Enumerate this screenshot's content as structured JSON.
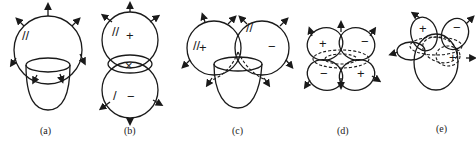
{
  "figure": {
    "panels": [
      {
        "id": "a",
        "caption": "(a)",
        "signs": [],
        "description": "single lobe above cup with outward arrows"
      },
      {
        "id": "b",
        "caption": "(b)",
        "signs": [
          "+",
          "×",
          "−"
        ],
        "description": "two vertically stacked lobes"
      },
      {
        "id": "c",
        "caption": "(c)",
        "signs": [
          "+",
          "−"
        ],
        "description": "two side lobes above cup"
      },
      {
        "id": "d",
        "caption": "(d)",
        "signs": [
          "+",
          "−",
          "−",
          "+"
        ],
        "description": "four-leaf cloverleaf lobes"
      },
      {
        "id": "e",
        "caption": "(e)",
        "signs": [
          "+",
          "−",
          "+"
        ],
        "description": "tilted cloverleaf over ellipsoid"
      }
    ]
  }
}
